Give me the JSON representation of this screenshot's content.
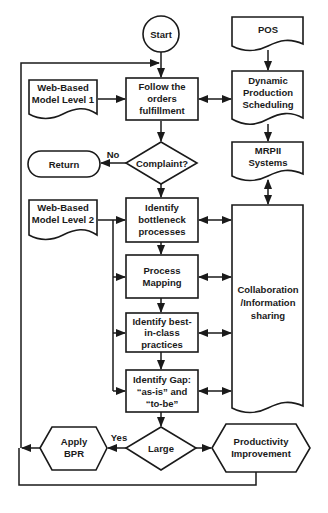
{
  "diagram": {
    "type": "flowchart",
    "nodes": {
      "start": {
        "label": "Start",
        "shape": "circle"
      },
      "follow": {
        "lines": [
          "Follow the",
          "orders",
          "fulfillment"
        ],
        "shape": "process"
      },
      "web1": {
        "lines": [
          "Web-Based",
          "Model Level 1"
        ],
        "shape": "document"
      },
      "pos": {
        "label": "POS",
        "shape": "document"
      },
      "dynamic": {
        "lines": [
          "Dynamic",
          "Production",
          "Scheduling"
        ],
        "shape": "document"
      },
      "mrp": {
        "lines": [
          "MRPII",
          "Systems"
        ],
        "shape": "document"
      },
      "complaint": {
        "label": "Complaint?",
        "shape": "decision"
      },
      "return": {
        "label": "Return",
        "shape": "terminator"
      },
      "web2": {
        "lines": [
          "Web-Based",
          "Model Level 2"
        ],
        "shape": "document"
      },
      "bottleneck": {
        "lines": [
          "Identify",
          "bottleneck",
          "processes"
        ],
        "shape": "process"
      },
      "mapping": {
        "lines": [
          "Process",
          "Mapping"
        ],
        "shape": "process"
      },
      "best": {
        "lines": [
          "Identify best-",
          "in-class",
          "practices"
        ],
        "shape": "process"
      },
      "gap": {
        "lines": [
          "Identify Gap:",
          "“as-is” and",
          "“to-be”"
        ],
        "shape": "process"
      },
      "collab": {
        "lines": [
          "Collaboration",
          "/Information",
          "sharing"
        ],
        "shape": "document"
      },
      "large": {
        "label": "Large",
        "shape": "decision"
      },
      "bpr": {
        "lines": [
          "Apply",
          "BPR"
        ],
        "shape": "preparation"
      },
      "productivity": {
        "lines": [
          "Productivity",
          "Improvement"
        ],
        "shape": "preparation"
      }
    },
    "edge_labels": {
      "no": "No",
      "yes": "Yes"
    },
    "edges": [
      {
        "from": "start",
        "to": "follow"
      },
      {
        "from": "web1",
        "to": "follow"
      },
      {
        "from": "follow",
        "to": "dynamic",
        "bidirectional": true
      },
      {
        "from": "pos",
        "to": "dynamic"
      },
      {
        "from": "dynamic",
        "to": "mrp"
      },
      {
        "from": "follow",
        "to": "complaint"
      },
      {
        "from": "complaint",
        "to": "return",
        "label": "No"
      },
      {
        "from": "complaint",
        "to": "bottleneck"
      },
      {
        "from": "mrp",
        "to": "collab",
        "bidirectional": true
      },
      {
        "from": "web2",
        "to": "bottleneck"
      },
      {
        "from": "web2",
        "to": "mapping"
      },
      {
        "from": "web2",
        "to": "best"
      },
      {
        "from": "web2",
        "to": "gap"
      },
      {
        "from": "bottleneck",
        "to": "mapping"
      },
      {
        "from": "mapping",
        "to": "best"
      },
      {
        "from": "best",
        "to": "gap"
      },
      {
        "from": "bottleneck",
        "to": "collab",
        "bidirectional": true
      },
      {
        "from": "mapping",
        "to": "collab",
        "bidirectional": true
      },
      {
        "from": "best",
        "to": "collab",
        "bidirectional": true
      },
      {
        "from": "gap",
        "to": "collab",
        "bidirectional": true
      },
      {
        "from": "gap",
        "to": "large"
      },
      {
        "from": "large",
        "to": "bpr",
        "label": "Yes"
      },
      {
        "from": "large",
        "to": "productivity"
      },
      {
        "from": "bpr",
        "to": "follow",
        "note": "loop back via left edge"
      },
      {
        "from": "productivity",
        "to": "follow",
        "note": "loop back via bottom and left edge"
      }
    ],
    "colors": {
      "stroke": "#1a1a1a",
      "fill": "#ffffff",
      "text": "#1a1a1a"
    }
  }
}
